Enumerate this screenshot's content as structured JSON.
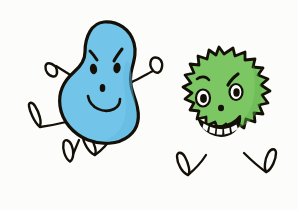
{
  "artwork": {
    "title": "Two cartoon germ characters",
    "medium": "hand-drawn ink and marker illustration",
    "background_color": "#fcfcfa",
    "ink_color": "#141008"
  },
  "characters": [
    {
      "id": "blue-blob",
      "name": "Blue blob germ",
      "body_shape": "bean",
      "body_color": "#72c4e8",
      "body_shadow_color": "#4fa9d6",
      "outline_color": "#141008",
      "expression": "mischievous smile with angry eyebrows",
      "pose": "running to the left",
      "face": {
        "eyebrows": "two angled slanted strokes",
        "eyes": "two filled oval eyes",
        "nose": "small filled oval dot",
        "mouth": "wide upward U smile"
      },
      "limbs": {
        "arms": 2,
        "legs": 2,
        "hand_shape": "oval loop",
        "foot_shape": "oval loop"
      }
    },
    {
      "id": "green-virus",
      "name": "Green spiky virus",
      "body_shape": "spiked star",
      "body_color": "#7cc764",
      "body_shadow_color": "#5aa844",
      "outline_color": "#141008",
      "expression": "sly toothy grin with arched eyebrows",
      "pose": "standing with legs apart",
      "spike_count": 20,
      "face": {
        "eyebrows": "two arched slanted strokes",
        "eyes": "two round eyes with filled pupils",
        "nose": "small filled dot",
        "mouth": "wide toothy grin",
        "teeth_count": 5
      },
      "limbs": {
        "arms": 0,
        "legs": 2,
        "foot_shape": "oval loop"
      }
    }
  ],
  "colors": {
    "blue_body": "#72c4e8",
    "blue_shade": "#4fa9d6",
    "green_body": "#7cc764",
    "green_shade": "#5aa844",
    "ink": "#141008",
    "paper": "#fcfcfa",
    "tooth": "#fcfcfa"
  }
}
